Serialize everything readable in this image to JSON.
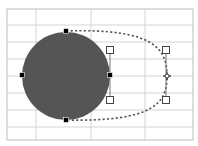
{
  "canvas": {
    "width": 198,
    "height": 146,
    "background": "#ffffff"
  },
  "grid": {
    "color": "#d4d4d4",
    "border_color": "#c8c8c8",
    "left": 7,
    "top": 9,
    "right": 193,
    "bottom": 140,
    "vertical_lines": [
      36,
      91,
      145
    ],
    "horizontal_lines": [
      25,
      42,
      59,
      76,
      93,
      110,
      127
    ]
  },
  "shape": {
    "type": "circle",
    "fill": "#555555",
    "cx": 66,
    "cy": 76,
    "r": 44
  },
  "path_edit": {
    "dash_color": "#555555",
    "anchor_handles": [
      {
        "name": "anchor-top",
        "x": 66,
        "y": 31
      },
      {
        "name": "anchor-left",
        "x": 22,
        "y": 75
      },
      {
        "name": "anchor-right",
        "x": 110,
        "y": 75
      },
      {
        "name": "anchor-bottom",
        "x": 66,
        "y": 120
      }
    ],
    "control_handles": [
      {
        "name": "control-inner-top",
        "x": 110,
        "y": 50
      },
      {
        "name": "control-inner-bottom",
        "x": 110,
        "y": 100
      },
      {
        "name": "control-outer-top",
        "x": 166,
        "y": 50
      },
      {
        "name": "control-outer-bottom",
        "x": 166,
        "y": 100
      }
    ],
    "drag_point": {
      "x": 167,
      "y": 76
    }
  }
}
